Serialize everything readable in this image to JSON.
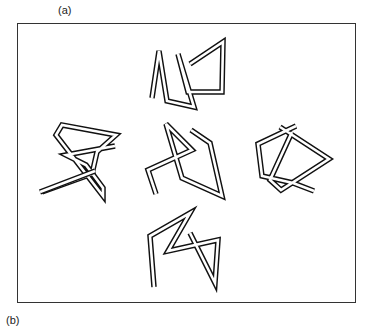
{
  "labels": {
    "a": "(a)",
    "b": "(b)"
  },
  "figure": {
    "frame_color": "#333333",
    "stroke_color": "#111111",
    "knots": [
      {
        "id": "top",
        "position": "top-center"
      },
      {
        "id": "center",
        "position": "center"
      },
      {
        "id": "left",
        "position": "middle-left"
      },
      {
        "id": "right",
        "position": "middle-right"
      },
      {
        "id": "bottom",
        "position": "bottom-center"
      }
    ]
  }
}
